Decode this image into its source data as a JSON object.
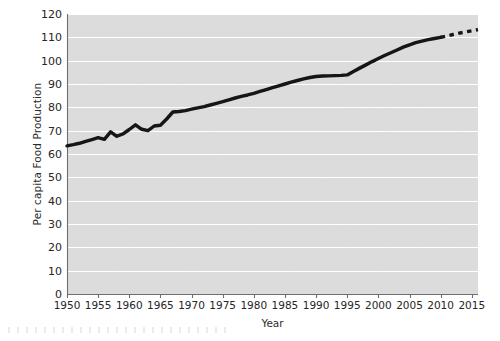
{
  "figure": {
    "name": "per-capita-food-production-chart",
    "background_color": "#ffffff",
    "plot_background_color": "#e3e3e3",
    "gridline_color": "#ffffff",
    "line_color": "#111111",
    "axis_color": "#6f6f6f"
  },
  "axes": {
    "x_title": "Year",
    "y_title": "Per capita Food Production"
  },
  "chart_data": {
    "type": "line",
    "title": "",
    "subtitle": "",
    "xlabel": "Year",
    "ylabel": "Per capita Food Production",
    "xlim": [
      1950,
      2016
    ],
    "ylim": [
      0,
      120
    ],
    "xticks": [
      1950,
      1955,
      1960,
      1965,
      1970,
      1975,
      1980,
      1985,
      1990,
      1995,
      2000,
      2005,
      2010,
      2015
    ],
    "xtick_labels": [
      "1950",
      "1955",
      "1960",
      "1965",
      "1970",
      "1975",
      "1980",
      "1985",
      "1990",
      "1995",
      "2000",
      "2005",
      "2010",
      "2015"
    ],
    "yticks": [
      0,
      10,
      20,
      30,
      40,
      50,
      60,
      70,
      80,
      90,
      100,
      110,
      120
    ],
    "ytick_labels": [
      "0",
      "10",
      "20",
      "30",
      "40",
      "50",
      "60",
      "70",
      "80",
      "90",
      "100",
      "110",
      "120"
    ],
    "grid": "horizontal",
    "legend": "none",
    "series": [
      {
        "name": "Per capita food production (observed)",
        "style": "solid",
        "x": [
          1950,
          1951,
          1952,
          1953,
          1954,
          1955,
          1956,
          1957,
          1958,
          1959,
          1960,
          1961,
          1962,
          1963,
          1964,
          1965,
          1966,
          1967,
          1968,
          1969,
          1970,
          1971,
          1972,
          1973,
          1974,
          1975,
          1976,
          1977,
          1978,
          1979,
          1980,
          1981,
          1982,
          1983,
          1984,
          1985,
          1986,
          1987,
          1988,
          1989,
          1990,
          1991,
          1992,
          1993,
          1994,
          1995,
          1996,
          1997,
          1998,
          1999,
          2000,
          2001,
          2002,
          2003,
          2004,
          2005,
          2006,
          2007,
          2008,
          2009,
          2010
        ],
        "y": [
          63.5,
          64.0,
          64.6,
          65.4,
          66.2,
          67.0,
          66.3,
          69.5,
          67.6,
          68.6,
          70.5,
          72.5,
          70.6,
          70.0,
          72.0,
          72.3,
          75.0,
          78.0,
          78.2,
          78.6,
          79.2,
          79.8,
          80.3,
          81.0,
          81.7,
          82.4,
          83.2,
          84.0,
          84.7,
          85.3,
          86.0,
          86.8,
          87.6,
          88.4,
          89.2,
          90.0,
          90.8,
          91.5,
          92.2,
          92.8,
          93.2,
          93.4,
          93.5,
          93.6,
          93.7,
          93.9,
          95.4,
          96.8,
          98.2,
          99.6,
          100.9,
          102.2,
          103.4,
          104.6,
          105.8,
          106.8,
          107.7,
          108.4,
          109.0,
          109.5,
          110.0
        ]
      },
      {
        "name": "Per capita food production (projected)",
        "style": "dashed",
        "x": [
          2010,
          2011,
          2012,
          2013,
          2014,
          2015,
          2016
        ],
        "y": [
          110.0,
          110.6,
          111.2,
          111.8,
          112.3,
          112.8,
          113.3
        ]
      }
    ]
  }
}
